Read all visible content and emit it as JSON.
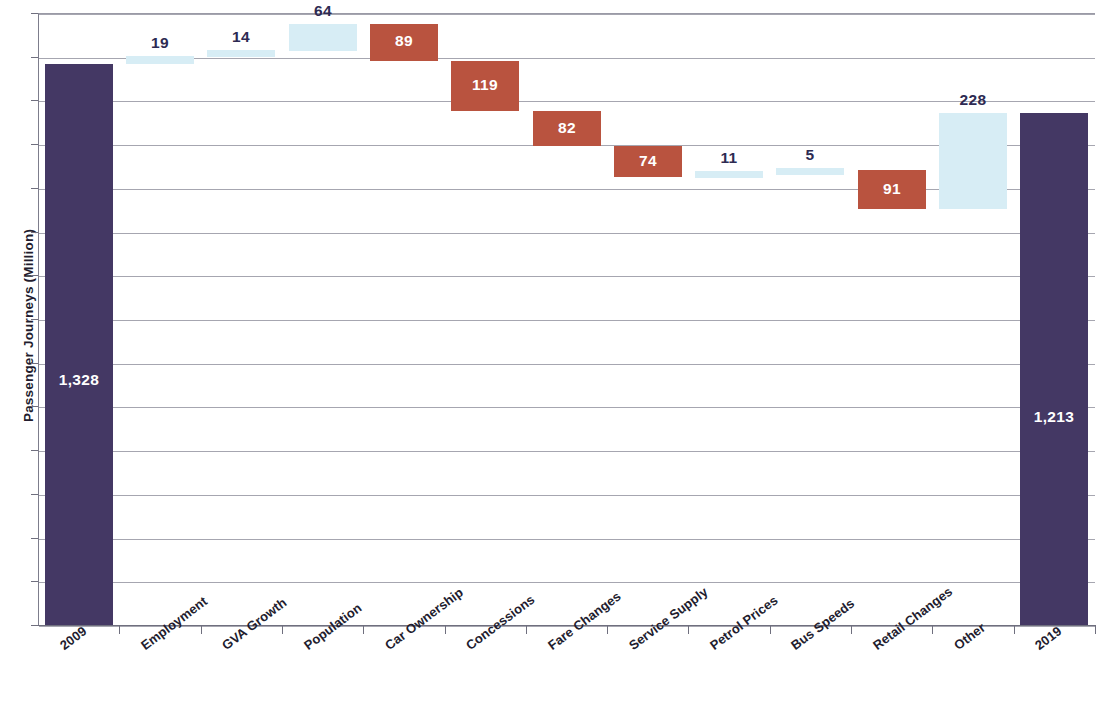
{
  "chart_data": {
    "type": "bar",
    "subtype": "waterfall",
    "title": "",
    "xlabel": "",
    "ylabel": "Passenger Journeys (Million)",
    "ylim": [
      0,
      1450
    ],
    "grid": true,
    "legend": null,
    "categories": [
      "2009",
      "Employment",
      "GVA Growth",
      "Population",
      "Car Ownership",
      "Concessions",
      "Fare Changes",
      "Service Supply",
      "Petrol Prices",
      "Bus Speeds",
      "Retail Changes",
      "Other",
      "2019"
    ],
    "values": [
      1328,
      19,
      14,
      64,
      -89,
      -119,
      -82,
      -74,
      11,
      5,
      -91,
      228,
      1213
    ],
    "labels": [
      "1,328",
      "19",
      "14",
      "64",
      "89",
      "119",
      "82",
      "74",
      "11",
      "5",
      "91",
      "228",
      "1,213"
    ],
    "kinds": [
      "total",
      "increase",
      "increase",
      "increase",
      "decrease",
      "decrease",
      "decrease",
      "decrease",
      "increase",
      "increase",
      "decrease",
      "increase",
      "total"
    ],
    "running_start": [
      0,
      1328,
      1347,
      1361,
      1425,
      1336,
      1217,
      1135,
      1061,
      1072,
      1077,
      986,
      0
    ],
    "running_end": [
      1328,
      1347,
      1361,
      1425,
      1336,
      1217,
      1135,
      1061,
      1072,
      1077,
      986,
      1214,
      1213
    ],
    "colors": {
      "total": "#443864",
      "decrease": "#b9533f",
      "increase": "#d7edf5",
      "gridline": "#a6a6b0",
      "axis": "#6f6f7e",
      "label_dark_text": "#2d2a52",
      "label_light_text": "#ffffff",
      "axis_text": "#221c2e"
    }
  },
  "axis": {
    "y_title": "Passenger Journeys (Million)"
  }
}
